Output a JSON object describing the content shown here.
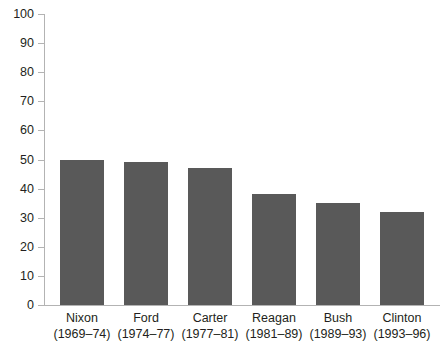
{
  "chart_data": {
    "type": "bar",
    "title": "",
    "xlabel": "",
    "ylabel": "",
    "ylim": [
      0,
      100
    ],
    "yticks": [
      0,
      10,
      20,
      30,
      40,
      50,
      60,
      70,
      80,
      90,
      100
    ],
    "grid": false,
    "legend": false,
    "categories": [
      "Nixon (1969–74)",
      "Ford (1974–77)",
      "Carter (1977–81)",
      "Reagan (1981–89)",
      "Bush (1989–93)",
      "Clinton (1993–96)"
    ],
    "values": [
      50,
      49,
      47,
      38,
      35,
      32
    ],
    "bars": [
      {
        "name": "Nixon",
        "years": "(1969–74)",
        "value": 50
      },
      {
        "name": "Ford",
        "years": "(1974–77)",
        "value": 49
      },
      {
        "name": "Carter",
        "years": "(1977–81)",
        "value": 47
      },
      {
        "name": "Reagan",
        "years": "(1981–89)",
        "value": 38
      },
      {
        "name": "Bush",
        "years": "(1989–93)",
        "value": 35
      },
      {
        "name": "Clinton",
        "years": "(1993–96)",
        "value": 32
      }
    ]
  },
  "axis": {
    "y_tick_labels": [
      "100",
      "90",
      "80",
      "70",
      "60",
      "50",
      "40",
      "30",
      "20",
      "10",
      "0"
    ]
  },
  "colors": {
    "bar_fill": "#595959",
    "axis_line": "#b3b3b3",
    "text": "#231f20",
    "background": "#ffffff"
  },
  "cropped_title_sliver": ""
}
